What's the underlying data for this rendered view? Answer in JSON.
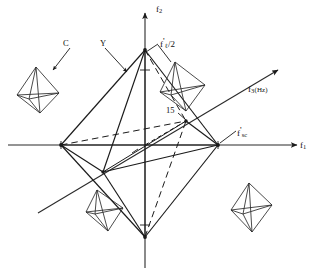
{
  "figure": {
    "background_color": "#ffffff",
    "line_color": "#1a1a1a",
    "axes": [
      {
        "id": "f1",
        "label_main": "f",
        "label_sub": "1",
        "label_suffix": "",
        "direction": "horizontal-right"
      },
      {
        "id": "f2",
        "label_main": "f",
        "label_sub": "2",
        "label_suffix": "",
        "direction": "vertical-up"
      },
      {
        "id": "f3",
        "label_main": "f",
        "label_sub": "3",
        "label_suffix": "(Hz)",
        "direction": "oblique-upper-right"
      }
    ],
    "annotations": [
      {
        "id": "c-callout",
        "text": "C",
        "description": "leader arrow to upper-left octahedron"
      },
      {
        "id": "y-callout",
        "text": "Y",
        "description": "leader arrow to main octahedron upper-left face"
      },
      {
        "id": "fl-half",
        "text_main": "f",
        "text_prime": "'",
        "text_sub": "ℓ",
        "text_suffix": "/2",
        "description": "leader line to top vertex region"
      },
      {
        "id": "fsc",
        "text_main": "f",
        "text_prime": "'",
        "text_sub": "sc",
        "description": "right vertex on f1 axis"
      },
      {
        "id": "fifteen",
        "text": "15",
        "description": "rear-upper-right vertex label"
      }
    ],
    "crystals": [
      {
        "id": "crystal-upper-left",
        "form": "octahedron",
        "tilt": "upright"
      },
      {
        "id": "crystal-upper-right",
        "form": "octahedron",
        "tilt": "tilted-right"
      },
      {
        "id": "crystal-lower-left",
        "form": "octahedron",
        "tilt": "tilted-left"
      },
      {
        "id": "crystal-lower-right",
        "form": "octahedron",
        "tilt": "upright"
      },
      {
        "id": "crystal-main",
        "form": "octahedron",
        "tilt": "upright",
        "scale": "large"
      }
    ]
  }
}
